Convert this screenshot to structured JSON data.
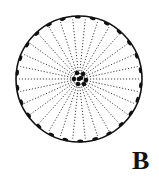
{
  "figure": {
    "label": "B",
    "circle": {
      "cx": 79,
      "cy": 79,
      "r": 63
    },
    "radial_line_count": 30,
    "marginal_bead_count": 26,
    "colors": {
      "ink": "#111111",
      "background": "#ffffff"
    }
  }
}
